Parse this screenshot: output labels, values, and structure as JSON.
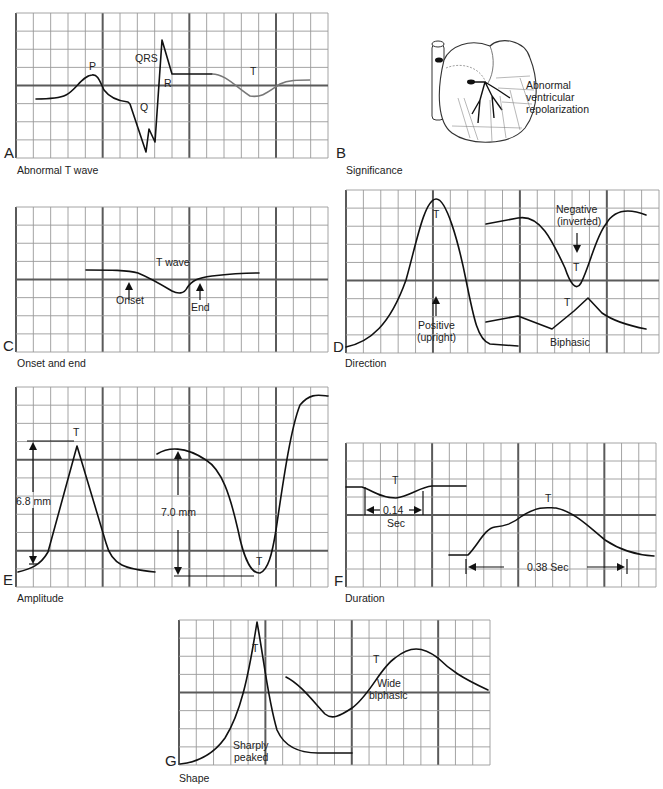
{
  "panels": {
    "A": {
      "letter": "A",
      "caption": "Abnormal T wave",
      "labels": {
        "p": "P",
        "qrs": "QRS",
        "q": "Q",
        "r": "R",
        "t": "T"
      }
    },
    "B": {
      "letter": "B",
      "caption": "Significance",
      "annotation_lines": [
        "Abnormal",
        "ventricular",
        "repolarization"
      ],
      "icon": "heart-conduction-icon"
    },
    "C": {
      "letter": "C",
      "caption": "Onset and end",
      "labels": {
        "t_wave": "T wave",
        "onset": "Onset",
        "end": "End"
      }
    },
    "D": {
      "letter": "D",
      "caption": "Direction",
      "labels": {
        "t_pos": "T",
        "positive_1": "Positive",
        "positive_2": "(upright)",
        "negative_1": "Negative",
        "negative_2": "(inverted)",
        "t_neg": "T",
        "t_bi": "T",
        "biphasic": "Biphasic"
      }
    },
    "E": {
      "letter": "E",
      "caption": "Amplitude",
      "labels": {
        "t1": "T",
        "amp1": "6.8 mm",
        "amp2": "7.0 mm",
        "t2": "T"
      }
    },
    "F": {
      "letter": "F",
      "caption": "Duration",
      "labels": {
        "t1": "T",
        "dur1": "0.14",
        "dur1_unit": "Sec",
        "t2": "T",
        "dur2": "0.38 Sec"
      }
    },
    "G": {
      "letter": "G",
      "caption": "Shape",
      "labels": {
        "t1": "T",
        "sharp_1": "Sharply",
        "sharp_2": "peaked",
        "t2": "T",
        "wide_1": "Wide",
        "wide_2": "biphasic"
      }
    }
  },
  "colors": {
    "grid_minor": "#9a9a9a",
    "grid_major": "#5a5a5a",
    "trace": "#111111",
    "trace_secondary": "#777777"
  }
}
